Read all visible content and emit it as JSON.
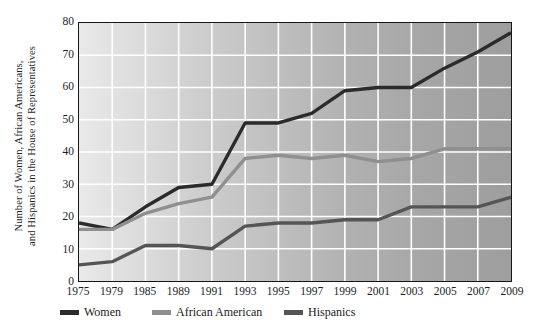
{
  "chart_data": {
    "type": "line",
    "title": "",
    "xlabel": "",
    "ylabel": "Number of Women, African Americans, and Hispanics in the House of Representatives",
    "ylabel_line1": "Number of Women, African Americans,",
    "ylabel_line2": "and Hispanics in the House of Representatives",
    "categories": [
      "1975",
      "1979",
      "1985",
      "1989",
      "1991",
      "1993",
      "1995",
      "1997",
      "1999",
      "2001",
      "2003",
      "2005",
      "2007",
      "2009"
    ],
    "xtick_labels": [
      "1975",
      "1979",
      "1985",
      "1989",
      "1991",
      "1993",
      "1995",
      "1997",
      "1999",
      "2001",
      "2003",
      "2005",
      "2007",
      "2009"
    ],
    "ytick_labels": [
      "0",
      "10",
      "20",
      "30",
      "40",
      "50",
      "60",
      "70",
      "80"
    ],
    "ytick_values": [
      0,
      10,
      20,
      30,
      40,
      50,
      60,
      70,
      80
    ],
    "ylim": [
      0,
      80
    ],
    "grid": true,
    "grid_color": "#ffffff",
    "legend_position": "below",
    "series": [
      {
        "name": "Women",
        "color": "#2b2b2b",
        "values": [
          18,
          16,
          23,
          29,
          30,
          49,
          49,
          52,
          59,
          60,
          60,
          66,
          71,
          77
        ]
      },
      {
        "name": "African American",
        "color": "#8f8f8f",
        "values": [
          16,
          16,
          21,
          24,
          26,
          38,
          39,
          38,
          39,
          37,
          38,
          41,
          41,
          41
        ]
      },
      {
        "name": "Hispanics",
        "color": "#555555",
        "values": [
          5,
          6,
          11,
          11,
          10,
          17,
          18,
          18,
          19,
          19,
          23,
          23,
          23,
          26
        ]
      }
    ]
  },
  "legend": {
    "items": [
      {
        "label": "Women",
        "color": "#2b2b2b"
      },
      {
        "label": "African American",
        "color": "#8f8f8f"
      },
      {
        "label": "Hispanics",
        "color": "#555555"
      }
    ]
  }
}
